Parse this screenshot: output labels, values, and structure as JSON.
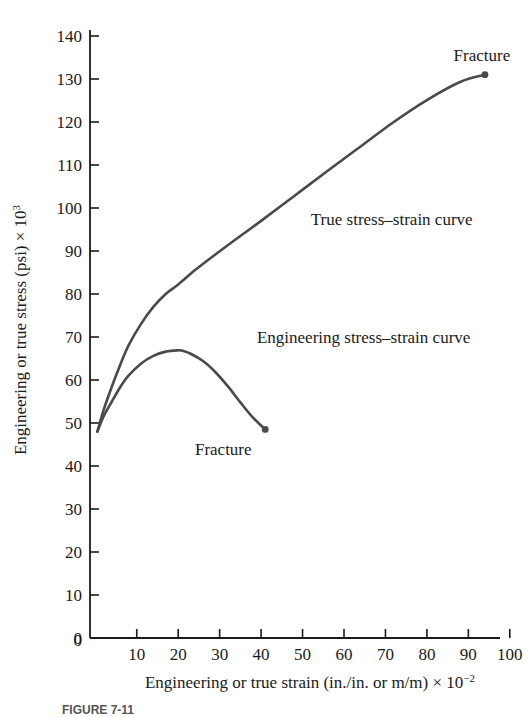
{
  "figure": {
    "caption": "FIGURE 7-11"
  },
  "chart_data": {
    "type": "line",
    "title": "",
    "xlabel": "Engineering or true strain (in./in. or m/m) × 10−2",
    "xlabel_base": "Engineering or true strain (in./in. or m/m) × 10",
    "xlabel_exp": "−2",
    "ylabel": "Engineering or true stress (psi) × 10³",
    "ylabel_base": "Engineering or true stress (psi) × 10",
    "ylabel_exp": "3",
    "xlim": [
      0,
      105
    ],
    "ylim": [
      0,
      145
    ],
    "xticks": [
      0,
      10,
      20,
      30,
      40,
      50,
      60,
      70,
      80,
      90,
      100
    ],
    "xtick_labels": [
      "0",
      "10",
      "20",
      "30",
      "40",
      "50",
      "60",
      "70",
      "80",
      "90",
      "100"
    ],
    "yticks": [
      0,
      10,
      20,
      30,
      40,
      50,
      60,
      70,
      80,
      90,
      100,
      110,
      120,
      130,
      140
    ],
    "ytick_labels": [
      "0",
      "10",
      "20",
      "30",
      "40",
      "50",
      "60",
      "70",
      "80",
      "90",
      "100",
      "110",
      "120",
      "130",
      "140"
    ],
    "grid": false,
    "legend": "none",
    "curve_color": "#4a4a4a",
    "axis_color": "#1a1a1a",
    "series": [
      {
        "name": "True stress–strain curve",
        "label": "True stress–strain curve",
        "label_x": 52,
        "label_y": 96,
        "fracture_label": "Fracture",
        "fracture_x": 94,
        "fracture_y": 131,
        "x": [
          0.5,
          2,
          4,
          6,
          8,
          11,
          14,
          17,
          20,
          24,
          28,
          34,
          40,
          48,
          56,
          64,
          72,
          80,
          88,
          94
        ],
        "y": [
          48,
          53,
          58.5,
          63.5,
          68,
          73,
          77,
          80,
          82.2,
          85.5,
          88.5,
          92.8,
          97,
          102.8,
          108.6,
          114.3,
          120,
          125.1,
          129.3,
          131
        ]
      },
      {
        "name": "Engineering stress–strain curve",
        "label": "Engineering stress–strain curve",
        "label_x": 39,
        "label_y": 68.5,
        "fracture_label": "Fracture",
        "fracture_x": 41,
        "fracture_y": 48.5,
        "x": [
          0.5,
          2,
          4,
          6,
          8,
          11,
          14,
          17,
          20,
          21,
          23,
          26,
          29,
          32,
          35,
          38,
          41
        ],
        "y": [
          48,
          51.5,
          55,
          58.3,
          61,
          63.8,
          65.6,
          66.6,
          66.9,
          66.8,
          66.1,
          64.4,
          61.8,
          58.5,
          54.8,
          51.3,
          48.5
        ]
      }
    ],
    "annotations": [
      {
        "text": "Fracture",
        "x": 94,
        "y": 131,
        "position": "above-right"
      },
      {
        "text": "Fracture",
        "x": 41,
        "y": 48.5,
        "position": "below-left"
      },
      {
        "text": "True stress–strain curve",
        "x": 52,
        "y": 96,
        "position": "right"
      },
      {
        "text": "Engineering stress–strain curve",
        "x": 39,
        "y": 68.5,
        "position": "right"
      }
    ]
  }
}
